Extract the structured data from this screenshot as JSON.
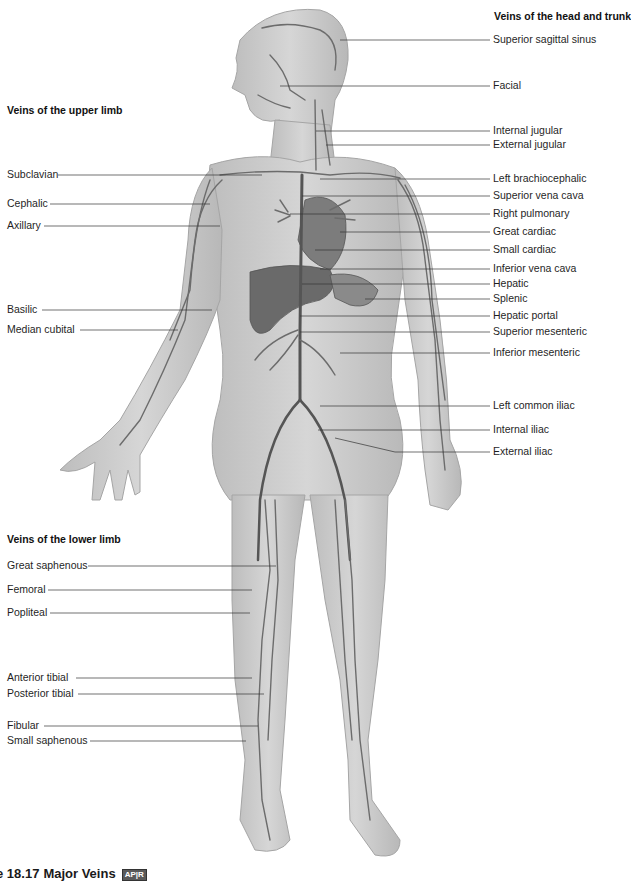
{
  "groups": {
    "head_trunk": "Veins of the head and trunk",
    "upper_limb": "Veins of the upper limb",
    "lower_limb": "Veins of the lower limb"
  },
  "labels_right": [
    {
      "text": "Superior sagittal sinus",
      "y": 38
    },
    {
      "text": "Facial",
      "y": 84
    },
    {
      "text": "Internal jugular",
      "y": 129
    },
    {
      "text": "External jugular",
      "y": 143
    },
    {
      "text": "Left brachiocephalic",
      "y": 177
    },
    {
      "text": "Superior vena cava",
      "y": 194
    },
    {
      "text": "Right pulmonary",
      "y": 212
    },
    {
      "text": "Great cardiac",
      "y": 230
    },
    {
      "text": "Small cardiac",
      "y": 248
    },
    {
      "text": "Inferior vena cava",
      "y": 267
    },
    {
      "text": "Hepatic",
      "y": 282
    },
    {
      "text": "Splenic",
      "y": 297
    },
    {
      "text": "Hepatic portal",
      "y": 314
    },
    {
      "text": "Superior mesenteric",
      "y": 330
    },
    {
      "text": "Inferior mesenteric",
      "y": 351
    },
    {
      "text": "Left common iliac",
      "y": 404
    },
    {
      "text": "Internal iliac",
      "y": 428
    },
    {
      "text": "External iliac",
      "y": 450
    }
  ],
  "labels_left": [
    {
      "text": "Subclavian",
      "y": 173
    },
    {
      "text": "Cephalic",
      "y": 202
    },
    {
      "text": "Axillary",
      "y": 224
    },
    {
      "text": "Basilic",
      "y": 308
    },
    {
      "text": "Median cubital",
      "y": 328
    },
    {
      "text": "Great saphenous",
      "y": 564
    },
    {
      "text": "Femoral",
      "y": 588
    },
    {
      "text": "Popliteal",
      "y": 611
    },
    {
      "text": "Anterior tibial",
      "y": 676
    },
    {
      "text": "Posterior tibial",
      "y": 692
    },
    {
      "text": "Fibular",
      "y": 724
    },
    {
      "text": "Small saphenous",
      "y": 739
    }
  ],
  "caption": {
    "number": "e 18.17",
    "title": "Major Veins",
    "badge": "AP|R"
  },
  "colors": {
    "skin": "#c9c9c9",
    "vein": "#6e6e6e",
    "organ": "#7a7a7a",
    "leader": "#333333"
  }
}
